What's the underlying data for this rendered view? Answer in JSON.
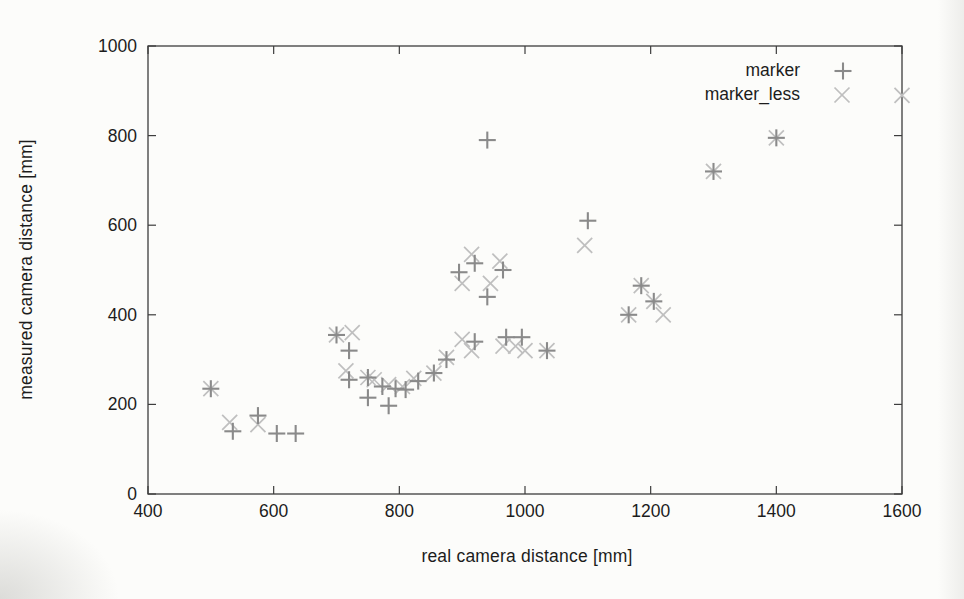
{
  "page": {
    "background": "#fcfcfa",
    "text_color": "#1c1c1c",
    "frame_color": "#3d3d3d"
  },
  "chart_data": {
    "type": "scatter",
    "title": "",
    "xlabel": "real camera distance [mm]",
    "ylabel": "measured camera distance [mm]",
    "xlim": [
      400,
      1600
    ],
    "ylim": [
      0,
      1000
    ],
    "xticks": [
      400,
      600,
      800,
      1000,
      1200,
      1400,
      1600
    ],
    "yticks": [
      0,
      200,
      400,
      600,
      800,
      1000
    ],
    "grid": false,
    "legend_position": "top-right-inside",
    "series": [
      {
        "name": "marker",
        "marker": "plus",
        "color": "#8a8a8a",
        "points": [
          [
            500,
            235
          ],
          [
            535,
            140
          ],
          [
            575,
            175
          ],
          [
            605,
            135
          ],
          [
            635,
            135
          ],
          [
            700,
            355
          ],
          [
            720,
            320
          ],
          [
            720,
            255
          ],
          [
            750,
            260
          ],
          [
            750,
            215
          ],
          [
            773,
            240
          ],
          [
            794,
            235
          ],
          [
            810,
            233
          ],
          [
            783,
            197
          ],
          [
            830,
            252
          ],
          [
            855,
            270
          ],
          [
            875,
            300
          ],
          [
            895,
            495
          ],
          [
            920,
            515
          ],
          [
            940,
            440
          ],
          [
            965,
            500
          ],
          [
            920,
            340
          ],
          [
            940,
            790
          ],
          [
            970,
            350
          ],
          [
            995,
            350
          ],
          [
            1035,
            320
          ],
          [
            1100,
            610
          ],
          [
            1165,
            400
          ],
          [
            1185,
            465
          ],
          [
            1205,
            430
          ],
          [
            1300,
            720
          ],
          [
            1400,
            795
          ]
        ]
      },
      {
        "name": "marker_less",
        "marker": "cross",
        "color": "#bfbfbf",
        "points": [
          [
            500,
            235
          ],
          [
            530,
            160
          ],
          [
            575,
            155
          ],
          [
            700,
            355
          ],
          [
            715,
            275
          ],
          [
            725,
            360
          ],
          [
            750,
            260
          ],
          [
            760,
            255
          ],
          [
            783,
            244
          ],
          [
            805,
            240
          ],
          [
            823,
            258
          ],
          [
            855,
            270
          ],
          [
            875,
            305
          ],
          [
            900,
            345
          ],
          [
            915,
            320
          ],
          [
            900,
            470
          ],
          [
            915,
            535
          ],
          [
            945,
            470
          ],
          [
            960,
            520
          ],
          [
            965,
            330
          ],
          [
            985,
            330
          ],
          [
            1000,
            320
          ],
          [
            1035,
            320
          ],
          [
            1095,
            555
          ],
          [
            1165,
            400
          ],
          [
            1185,
            465
          ],
          [
            1205,
            430
          ],
          [
            1220,
            400
          ],
          [
            1300,
            720
          ],
          [
            1400,
            795
          ],
          [
            1600,
            890
          ]
        ]
      }
    ]
  }
}
